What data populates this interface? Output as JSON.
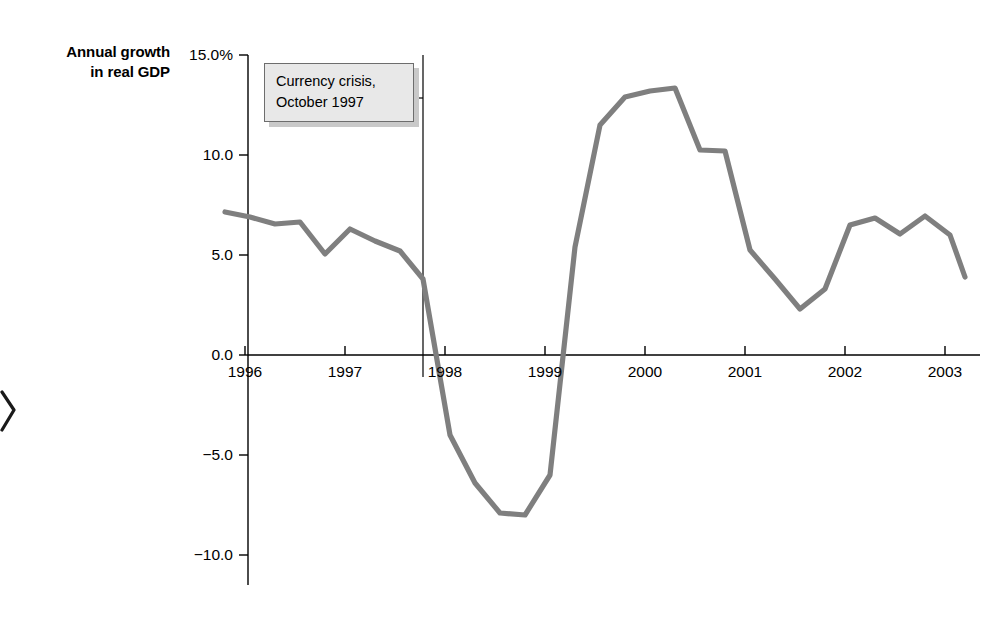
{
  "figure": {
    "axis_title_line1": "Annual growth",
    "axis_title_line2": "in real GDP"
  },
  "annotation": {
    "name": "currency-crisis-callout",
    "line1": "Currency crisis,",
    "line2": "October 1997",
    "marker_year": 1997.78,
    "box_fill": "#e8e8e8",
    "box_border": "#6d6d6d",
    "box_shadow": "#c9c9c9"
  },
  "colors": {
    "series_line": "#7f7f7f",
    "axis": "#000000",
    "background": "#ffffff",
    "text": "#000000"
  },
  "chart_data": {
    "type": "line",
    "title": "",
    "subtitle": "",
    "xlabel": "",
    "ylabel": "Annual growth in real GDP",
    "xlim": [
      1995.6,
      2003.35
    ],
    "ylim": [
      -11.5,
      15.0
    ],
    "grid": false,
    "legend": null,
    "yticks": [
      15.0,
      10.0,
      5.0,
      0.0,
      -5.0,
      -10.0
    ],
    "ytick_labels": [
      "15.0%",
      "10.0",
      "5.0",
      "0.0",
      "-5.0",
      "-10.0"
    ],
    "xticks": [
      1996,
      1997,
      1998,
      1999,
      2000,
      2001,
      2002,
      2003
    ],
    "xtick_labels": [
      "1996",
      "1997",
      "1998",
      "1999",
      "2000",
      "2001",
      "2002",
      "2003"
    ],
    "series": [
      {
        "name": "Annual growth in real GDP",
        "color": "#7f7f7f",
        "x": [
          1995.8,
          1996.05,
          1996.3,
          1996.55,
          1996.8,
          1997.05,
          1997.3,
          1997.55,
          1997.78,
          1998.05,
          1998.3,
          1998.55,
          1998.8,
          1999.05,
          1999.3,
          1999.55,
          1999.8,
          2000.05,
          2000.3,
          2000.55,
          2000.8,
          2001.05,
          2001.3,
          2001.55,
          2001.8,
          2002.05,
          2002.3,
          2002.55,
          2002.8,
          2003.05,
          2003.2
        ],
        "y": [
          7.15,
          6.9,
          6.55,
          6.65,
          5.05,
          6.3,
          5.7,
          5.2,
          3.8,
          -4.0,
          -6.4,
          -7.9,
          -8.0,
          -6.0,
          5.4,
          11.5,
          12.9,
          13.2,
          13.35,
          10.25,
          10.2,
          5.25,
          3.8,
          2.3,
          3.3,
          6.5,
          6.85,
          6.05,
          6.95,
          6.0,
          3.9
        ]
      }
    ]
  }
}
